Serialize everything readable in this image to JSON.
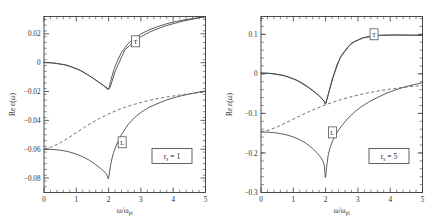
{
  "figure": {
    "background": "#ffffff",
    "ink": "#3a3a3a",
    "panel_count": 2
  },
  "chart_data": [
    {
      "type": "line",
      "panel": "left",
      "title": "",
      "xlabel": "ω/ω",
      "xlabel_sub": "pl",
      "ylabel": "Re  ε(ω)",
      "ylabel_sub": "",
      "annotation": "r",
      "annotation_sub": "s",
      "annotation_rest": " = 1",
      "xlim": [
        0,
        5
      ],
      "ylim": [
        -0.09,
        0.032
      ],
      "xticks": [
        0,
        1,
        2,
        3,
        4,
        5
      ],
      "xticklabels": [
        "0",
        "1",
        "2",
        "3",
        "4",
        "5"
      ],
      "yticks": [
        0.02,
        0,
        -0.02,
        -0.04,
        -0.06,
        -0.08
      ],
      "yticklabels": [
        "0.02",
        "0",
        "−0.02",
        "−0.04",
        "−0.06",
        "−0.08"
      ],
      "grid": false,
      "legend_position": "in-plot-boxed-markers",
      "series": [
        {
          "name": "T",
          "style": "solid",
          "label_marker": "T",
          "label_x": 2.83,
          "label_y": 0.0148,
          "x": [
            0.0,
            0.2,
            0.4,
            0.6,
            0.8,
            1.0,
            1.2,
            1.4,
            1.6,
            1.75,
            1.85,
            1.92,
            1.96,
            1.99,
            2.01,
            2.03,
            2.06,
            2.1,
            2.16,
            2.25,
            2.4,
            2.6,
            2.8,
            3.0,
            3.25,
            3.5,
            3.8,
            4.1,
            4.4,
            4.7,
            5.0
          ],
          "y": [
            0.0002,
            0.0,
            -0.0005,
            -0.0013,
            -0.0025,
            -0.0042,
            -0.0063,
            -0.009,
            -0.0121,
            -0.0144,
            -0.0159,
            -0.017,
            -0.0177,
            -0.0185,
            -0.0176,
            -0.016,
            -0.0132,
            -0.0098,
            -0.0052,
            0.0002,
            0.0072,
            0.0131,
            0.017,
            0.0199,
            0.0227,
            0.0248,
            0.027,
            0.0286,
            0.0299,
            0.0309,
            0.0318
          ]
        },
        {
          "name": "T-companion",
          "style": "solid",
          "label_marker": "",
          "x": [
            0.0,
            0.3,
            0.7,
            1.1,
            1.5,
            1.8,
            1.95,
            2.0,
            2.05,
            2.2,
            2.5,
            2.9,
            3.3,
            3.8,
            4.3,
            4.8,
            5.0
          ],
          "y": [
            0.0002,
            -0.0003,
            -0.0017,
            -0.005,
            -0.0104,
            -0.0152,
            -0.018,
            -0.0186,
            -0.017,
            -0.0062,
            0.0088,
            0.0168,
            0.0216,
            0.0258,
            0.0288,
            0.0311,
            0.0318
          ]
        },
        {
          "name": "L",
          "style": "solid",
          "label_marker": "L",
          "label_x": 2.42,
          "label_y": -0.0552,
          "x": [
            0.0,
            0.2,
            0.4,
            0.6,
            0.8,
            1.0,
            1.2,
            1.4,
            1.6,
            1.75,
            1.85,
            1.92,
            1.96,
            1.99,
            2.01,
            2.03,
            2.06,
            2.1,
            2.16,
            2.25,
            2.4,
            2.6,
            2.8,
            3.0,
            3.25,
            3.5,
            3.8,
            4.1,
            4.4,
            4.7,
            5.0
          ],
          "y": [
            -0.06,
            -0.0601,
            -0.0604,
            -0.061,
            -0.062,
            -0.0634,
            -0.0652,
            -0.0676,
            -0.0707,
            -0.0733,
            -0.0752,
            -0.0769,
            -0.0783,
            -0.0805,
            -0.079,
            -0.0757,
            -0.0712,
            -0.0668,
            -0.062,
            -0.0566,
            -0.0497,
            -0.043,
            -0.0381,
            -0.0345,
            -0.031,
            -0.0285,
            -0.0258,
            -0.0238,
            -0.0222,
            -0.0208,
            -0.0196
          ]
        },
        {
          "name": "L-dashed",
          "style": "dashed",
          "label_marker": "",
          "x": [
            0.0,
            0.25,
            0.5,
            0.75,
            1.0,
            1.25,
            1.5,
            1.75,
            2.0,
            2.25,
            2.5,
            2.75,
            3.0,
            3.25,
            3.5,
            3.75,
            4.0,
            4.3,
            4.6,
            5.0
          ],
          "y": [
            -0.06,
            -0.0583,
            -0.0556,
            -0.0522,
            -0.0485,
            -0.0448,
            -0.0414,
            -0.0383,
            -0.0355,
            -0.0331,
            -0.031,
            -0.0292,
            -0.0276,
            -0.0262,
            -0.025,
            -0.024,
            -0.0231,
            -0.0221,
            -0.0213,
            -0.0203
          ]
        }
      ]
    },
    {
      "type": "line",
      "panel": "right",
      "title": "",
      "xlabel": "ω/ω",
      "xlabel_sub": "pl",
      "ylabel": "Re  ε(ω)",
      "ylabel_sub": "",
      "annotation": "r",
      "annotation_sub": "s",
      "annotation_rest": " = 5",
      "xlim": [
        0,
        5
      ],
      "ylim": [
        -0.3,
        0.145
      ],
      "xticks": [
        0,
        1,
        2,
        3,
        4,
        5
      ],
      "xticklabels": [
        "0",
        "1",
        "2",
        "3",
        "4",
        "5"
      ],
      "yticks": [
        0.1,
        0,
        -0.1,
        -0.2,
        -0.3
      ],
      "yticklabels": [
        "0.1",
        "0",
        "−0.1",
        "−0.2",
        "−0.3"
      ],
      "grid": false,
      "legend_position": "in-plot-boxed-markers",
      "series": [
        {
          "name": "T",
          "style": "solid",
          "label_marker": "T",
          "label_x": 3.5,
          "label_y": 0.1,
          "x": [
            0.0,
            0.2,
            0.4,
            0.6,
            0.8,
            1.0,
            1.2,
            1.4,
            1.6,
            1.75,
            1.85,
            1.92,
            1.96,
            1.99,
            2.01,
            2.04,
            2.08,
            2.14,
            2.22,
            2.35,
            2.5,
            2.7,
            2.9,
            3.1,
            3.35,
            3.6,
            3.9,
            4.2,
            4.5,
            4.8,
            5.0
          ],
          "y": [
            0.002,
            0.0016,
            0.0002,
            -0.0025,
            -0.0066,
            -0.0124,
            -0.02,
            -0.0296,
            -0.0417,
            -0.052,
            -0.0595,
            -0.0655,
            -0.0697,
            -0.076,
            -0.073,
            -0.065,
            -0.053,
            -0.036,
            -0.012,
            0.023,
            0.048,
            0.069,
            0.082,
            0.0895,
            0.0945,
            0.097,
            0.098,
            0.0982,
            0.098,
            0.0976,
            0.0972
          ]
        },
        {
          "name": "T-companion",
          "style": "solid",
          "label_marker": "",
          "x": [
            0.0,
            0.3,
            0.7,
            1.1,
            1.5,
            1.8,
            1.95,
            2.0,
            2.06,
            2.2,
            2.45,
            2.8,
            3.2,
            3.7,
            4.2,
            4.8,
            5.0
          ],
          "y": [
            0.002,
            0.001,
            -0.004,
            -0.0158,
            -0.0365,
            -0.0555,
            -0.069,
            -0.0768,
            -0.059,
            -0.015,
            0.041,
            0.078,
            0.092,
            0.0975,
            0.0982,
            0.0976,
            0.0972
          ]
        },
        {
          "name": "L",
          "style": "solid",
          "label_marker": "L",
          "label_x": 2.21,
          "label_y": -0.148,
          "x": [
            0.0,
            0.2,
            0.4,
            0.6,
            0.8,
            1.0,
            1.2,
            1.4,
            1.6,
            1.75,
            1.85,
            1.92,
            1.96,
            1.99,
            2.01,
            2.04,
            2.08,
            2.14,
            2.22,
            2.35,
            2.5,
            2.7,
            2.9,
            3.1,
            3.35,
            3.6,
            3.9,
            4.2,
            4.5,
            4.8,
            5.0
          ],
          "y": [
            -0.147,
            -0.1474,
            -0.1487,
            -0.151,
            -0.1545,
            -0.1595,
            -0.1665,
            -0.176,
            -0.189,
            -0.201,
            -0.211,
            -0.221,
            -0.232,
            -0.262,
            -0.255,
            -0.23,
            -0.206,
            -0.186,
            -0.169,
            -0.149,
            -0.131,
            -0.1115,
            -0.096,
            -0.0835,
            -0.0705,
            -0.06,
            -0.0485,
            -0.0395,
            -0.032,
            -0.026,
            -0.0225
          ]
        },
        {
          "name": "L-dashed",
          "style": "dashed",
          "label_marker": "",
          "x": [
            0.0,
            0.25,
            0.5,
            0.75,
            1.0,
            1.25,
            1.5,
            1.75,
            2.0,
            2.25,
            2.5,
            2.75,
            3.0,
            3.25,
            3.5,
            3.75,
            4.0,
            4.3,
            4.6,
            5.0
          ],
          "y": [
            -0.147,
            -0.142,
            -0.134,
            -0.1245,
            -0.1145,
            -0.1045,
            -0.095,
            -0.0862,
            -0.0782,
            -0.071,
            -0.0645,
            -0.0588,
            -0.0537,
            -0.0492,
            -0.0452,
            -0.0417,
            -0.0386,
            -0.0353,
            -0.0325,
            -0.0293
          ]
        }
      ]
    }
  ]
}
